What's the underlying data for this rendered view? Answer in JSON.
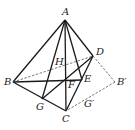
{
  "diagram": {
    "type": "geometry-figure",
    "points": {
      "A": [
        65,
        20
      ],
      "B": [
        13,
        82
      ],
      "C": [
        66,
        111
      ],
      "D": [
        93,
        56
      ],
      "E": [
        82,
        80
      ],
      "F": [
        66,
        79
      ],
      "G": [
        42,
        99
      ],
      "H": [
        55,
        62
      ],
      "Bp": [
        115,
        82
      ]
    },
    "labels": {
      "A": "A",
      "B": "B",
      "C": "C",
      "D": "D",
      "E": "E",
      "F": "F",
      "G": "G",
      "H": "H",
      "Bp": "B′",
      "Gp": "G′"
    },
    "solid_edges": [
      [
        "A",
        "B"
      ],
      [
        "A",
        "C"
      ],
      [
        "A",
        "D"
      ],
      [
        "A",
        "G"
      ],
      [
        "A",
        "E"
      ],
      [
        "B",
        "C"
      ],
      [
        "C",
        "D"
      ],
      [
        "B",
        "E"
      ],
      [
        "G",
        "D"
      ]
    ],
    "dashed_edges": [
      [
        "B",
        "D"
      ],
      [
        "D",
        "Bp"
      ],
      [
        "Bp",
        "C"
      ]
    ],
    "colors": {
      "line": "#1a1a1a",
      "dashed": "#555555"
    }
  }
}
